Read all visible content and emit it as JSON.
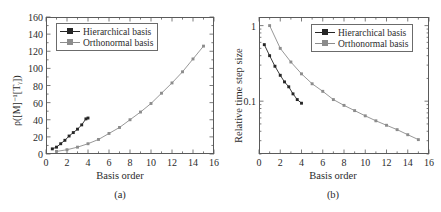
{
  "figure": {
    "panels": [
      {
        "caption": "(a)",
        "xlabel": "Basis order",
        "ylabel": "ρ([M]⁻¹[Tᵧ])",
        "legend": [
          {
            "label": "Hierarchical basis",
            "color": "#262626"
          },
          {
            "label": "Orthonormal basis",
            "color": "#8c8c8c"
          }
        ]
      },
      {
        "caption": "(b)",
        "xlabel": "Basis order",
        "ylabel": "Relative time step size",
        "legend": [
          {
            "label": "Hierarchical basis",
            "color": "#262626"
          },
          {
            "label": "Orthonormal basis",
            "color": "#8c8c8c"
          }
        ]
      }
    ]
  },
  "chart_data": [
    {
      "type": "line",
      "title": "",
      "subplot": "(a)",
      "xlabel": "Basis order",
      "ylabel": "ρ([M]⁻¹[Tᵧ])",
      "xlim": [
        0,
        16
      ],
      "ylim": [
        0,
        160
      ],
      "xticks": [
        0,
        2,
        4,
        6,
        8,
        10,
        12,
        14,
        16
      ],
      "yticks": [
        0,
        20,
        40,
        60,
        80,
        100,
        120,
        140,
        160
      ],
      "yscale": "linear",
      "grid": false,
      "legend_position": "upper-left",
      "series": [
        {
          "name": "Hierarchical basis",
          "color": "#262626",
          "marker": "square",
          "x": [
            0.6,
            1.0,
            1.4,
            1.8,
            2.2,
            2.6,
            3.0,
            3.4,
            3.8,
            4.0
          ],
          "y": [
            6,
            8,
            12,
            16,
            21,
            25,
            29,
            34,
            41,
            42
          ]
        },
        {
          "name": "Orthonormal basis",
          "color": "#8c8c8c",
          "marker": "square",
          "x": [
            1,
            2,
            3,
            4,
            5,
            6,
            7,
            8,
            9,
            10,
            11,
            12,
            13,
            14,
            15
          ],
          "y": [
            3,
            5,
            8,
            12,
            17,
            24,
            31,
            40,
            49,
            59,
            71,
            83,
            96,
            111,
            126,
            143
          ]
        }
      ]
    },
    {
      "type": "line",
      "title": "",
      "subplot": "(b)",
      "xlabel": "Basis order",
      "ylabel": "Relative time step size",
      "xlim": [
        0,
        16
      ],
      "ylim": [
        0.02,
        1.3
      ],
      "xticks": [
        0,
        2,
        4,
        6,
        8,
        10,
        12,
        14,
        16
      ],
      "yticks": [
        1,
        0.1
      ],
      "yscale": "log",
      "grid": false,
      "legend_position": "upper-right",
      "series": [
        {
          "name": "Hierarchical basis",
          "color": "#262626",
          "marker": "square",
          "x": [
            0.5,
            1.0,
            1.5,
            2.0,
            2.4,
            2.8,
            3.2,
            3.6,
            4.0
          ],
          "y": [
            0.56,
            0.4,
            0.29,
            0.22,
            0.18,
            0.155,
            0.125,
            0.105,
            0.094
          ]
        },
        {
          "name": "Orthonormal basis",
          "color": "#8c8c8c",
          "marker": "square",
          "x": [
            1,
            2,
            3,
            4,
            5,
            6,
            7,
            8,
            9,
            10,
            11,
            12,
            13,
            14,
            15
          ],
          "y": [
            1.0,
            0.5,
            0.33,
            0.23,
            0.17,
            0.135,
            0.105,
            0.088,
            0.075,
            0.064,
            0.055,
            0.048,
            0.042,
            0.036,
            0.031
          ]
        }
      ]
    }
  ]
}
